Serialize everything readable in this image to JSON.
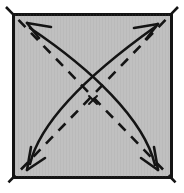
{
  "figure": {
    "title": "Fold diagram: square sheet with two diagonal creases and two double-headed curved fold arrows",
    "type": "origami-fold-diagram",
    "canvas": {
      "width": 184,
      "height": 193,
      "background": "#ffffff"
    }
  },
  "colors": {
    "paper_fill": "#c0c0c0",
    "paper_border": "#141414",
    "crease_line": "#141414",
    "arrow_line": "#141414",
    "center_mark": "#141414",
    "background": "#ffffff"
  },
  "sheet": {
    "name": "paper-square",
    "shape": "square",
    "x": 12,
    "y": 13,
    "width": 160,
    "height": 165,
    "border_width": 2.5,
    "fill": "#c0c0c0",
    "label": "Square sheet of paper"
  },
  "creases": [
    {
      "name": "crease-diagonal-nw-se",
      "style": "dashed",
      "meaning": "valley-fold crease",
      "dash_pattern": "10 8",
      "stroke_width": 2.6,
      "from": {
        "x": 6,
        "y": 7
      },
      "to": {
        "x": 178,
        "y": 185
      },
      "label": "Diagonal crease from top-left to bottom-right"
    },
    {
      "name": "crease-diagonal-ne-sw",
      "style": "dashed",
      "meaning": "valley-fold crease",
      "dash_pattern": "10 8",
      "stroke_width": 2.6,
      "from": {
        "x": 178,
        "y": 7
      },
      "to": {
        "x": 6,
        "y": 185
      },
      "label": "Diagonal crease from top-right to bottom-left"
    }
  ],
  "arrows": [
    {
      "name": "fold-arrow-sw-to-ne",
      "style": "solid-curved",
      "heads": 2,
      "stroke_width": 2.6,
      "head_style": "open-v",
      "path": "M 29 165 C 40 120, 95 70, 156 28",
      "tail_point": {
        "x": 29,
        "y": 165
      },
      "head_point": {
        "x": 156,
        "y": 28
      },
      "label": "Curved double-headed arrow between bottom-left and top-right corners"
    },
    {
      "name": "fold-arrow-se-to-nw",
      "style": "solid-curved",
      "heads": 2,
      "stroke_width": 2.6,
      "head_style": "open-v",
      "path": "M 156 166 C 145 120, 92 70, 29 27",
      "tail_point": {
        "x": 156,
        "y": 166
      },
      "head_point": {
        "x": 29,
        "y": 27
      },
      "label": "Curved double-headed arrow between bottom-right and top-left corners"
    }
  ],
  "center_mark": {
    "name": "center-cross-mark",
    "glyph": "x",
    "x": 93,
    "y": 100,
    "size": 10,
    "stroke_width": 1.8,
    "label": "Small cross marking the center point of the sheet"
  },
  "arrowheads": [
    {
      "name": "arrowhead-top-left",
      "tip": {
        "x": 27,
        "y": 24
      },
      "direction": "up-left"
    },
    {
      "name": "arrowhead-top-right",
      "tip": {
        "x": 158,
        "y": 25
      },
      "direction": "up-right"
    },
    {
      "name": "arrowhead-bottom-left",
      "tip": {
        "x": 27,
        "y": 169
      },
      "direction": "down-left"
    },
    {
      "name": "arrowhead-bottom-right",
      "tip": {
        "x": 158,
        "y": 169
      },
      "direction": "down-right"
    }
  ]
}
